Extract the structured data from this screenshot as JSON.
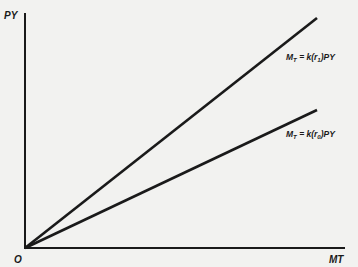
{
  "diagram": {
    "y_axis_label": "PY",
    "x_axis_label": "MT",
    "origin_label": "O",
    "lines": [
      {
        "name": "steep-line",
        "label_main": "M",
        "label_sub": "T",
        "label_rest": " = k(r",
        "label_rsub": "1",
        "label_end": ")PY"
      },
      {
        "name": "shallow-line",
        "label_main": "M",
        "label_sub": "T",
        "label_rest": " = k(r",
        "label_rsub": "0",
        "label_end": ")PY"
      }
    ],
    "colors": {
      "background": "#f2f2f0",
      "ink": "#1a1a1a"
    }
  }
}
